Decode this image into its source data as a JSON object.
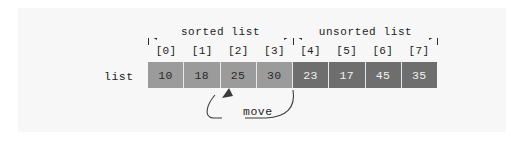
{
  "figure": {
    "list_label": "list",
    "move_label": "move",
    "colors": {
      "background": "#ffffff",
      "panel": "#f7f7f8",
      "sorted_cell": "#9b9b9b",
      "unsorted_cell": "#6e6e6e",
      "sorted_text": "#2a2a2a",
      "unsorted_text": "#f2f2f2",
      "ink": "#1d1d1d",
      "cell_divider": "#e9e9e9"
    }
  },
  "regions": [
    {
      "label": "sorted list",
      "start_index": 0,
      "end_index": 3
    },
    {
      "label": "unsorted list",
      "start_index": 4,
      "end_index": 7
    }
  ],
  "indices": [
    "[0]",
    "[1]",
    "[2]",
    "[3]",
    "[4]",
    "[5]",
    "[6]",
    "[7]"
  ],
  "cells": [
    {
      "index": "[0]",
      "value": "10",
      "region": "sorted"
    },
    {
      "index": "[1]",
      "value": "18",
      "region": "sorted"
    },
    {
      "index": "[2]",
      "value": "25",
      "region": "sorted"
    },
    {
      "index": "[3]",
      "value": "30",
      "region": "sorted"
    },
    {
      "index": "[4]",
      "value": "23",
      "region": "unsorted"
    },
    {
      "index": "[5]",
      "value": "17",
      "region": "unsorted"
    },
    {
      "index": "[6]",
      "value": "45",
      "region": "unsorted"
    },
    {
      "index": "[7]",
      "value": "35",
      "region": "unsorted"
    }
  ],
  "move_annotation": {
    "label": "move",
    "from_index": "[4]",
    "to_index": "[2]",
    "from_value": "23",
    "to_value": "25"
  }
}
